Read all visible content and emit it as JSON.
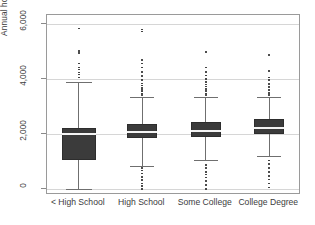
{
  "chart_data": {
    "type": "box",
    "title": "",
    "xlabel": "",
    "ylabel": "Annual hours worked by education",
    "ylim": [
      0,
      6400
    ],
    "grid": true,
    "legend": "none",
    "categories": [
      "< High School",
      "High School",
      "Some College",
      "College Degree"
    ],
    "ytick_labels": [
      "0",
      "2,000",
      "4,000",
      "6,000"
    ],
    "ytick_values": [
      0,
      2000,
      4000,
      6000
    ],
    "boxes": [
      {
        "category": "< High School",
        "whisker_low": 0,
        "q1": 1050,
        "median": 2000,
        "q3": 2220,
        "whisker_high": 3900,
        "outliers": [
          4060,
          4160,
          4240,
          4340,
          4420,
          4560,
          4940,
          5020,
          5840
        ]
      },
      {
        "category": "High School",
        "whisker_low": 850,
        "q1": 1850,
        "median": 2070,
        "q3": 2360,
        "whisker_high": 3350,
        "outliers": [
          3420,
          3480,
          3540,
          3600,
          3680,
          3760,
          3840,
          3960,
          4100,
          4260,
          4420,
          4560,
          4700,
          5720,
          5800
        ]
      },
      {
        "category": "Some College",
        "whisker_low": 1050,
        "q1": 1890,
        "median": 2110,
        "q3": 2430,
        "whisker_high": 3350,
        "outliers": [
          3420,
          3480,
          3560,
          3640,
          3720,
          3800,
          3900,
          4000,
          4120,
          4260,
          4420,
          4980
        ]
      },
      {
        "category": "College Degree",
        "whisker_low": 1200,
        "q1": 2000,
        "median": 2220,
        "q3": 2540,
        "whisker_high": 3350,
        "outliers": [
          3420,
          3500,
          3600,
          3700,
          3820,
          3960,
          4060,
          4300,
          4880
        ]
      }
    ],
    "low_outliers": [
      {
        "category": "< High School",
        "values": []
      },
      {
        "category": "High School",
        "values": [
          0,
          100,
          200,
          320,
          440,
          560,
          680,
          760
        ]
      },
      {
        "category": "Some College",
        "values": [
          0,
          140,
          300,
          420,
          520,
          620,
          760,
          880
        ]
      },
      {
        "category": "College Degree",
        "values": [
          60,
          200,
          340,
          480,
          620,
          760,
          900,
          1040
        ]
      }
    ],
    "colors": {
      "box_fill": "#3b3b3b",
      "box_edge": "#2d2d2d",
      "median": "#f4f4f4",
      "whisker": "#6f6f6f",
      "outlier": "#2a2a2a",
      "gridline": "#d6d6d6",
      "frame": "#9a9a9a",
      "text": "#3c3c3c",
      "background": "#ffffff"
    }
  }
}
